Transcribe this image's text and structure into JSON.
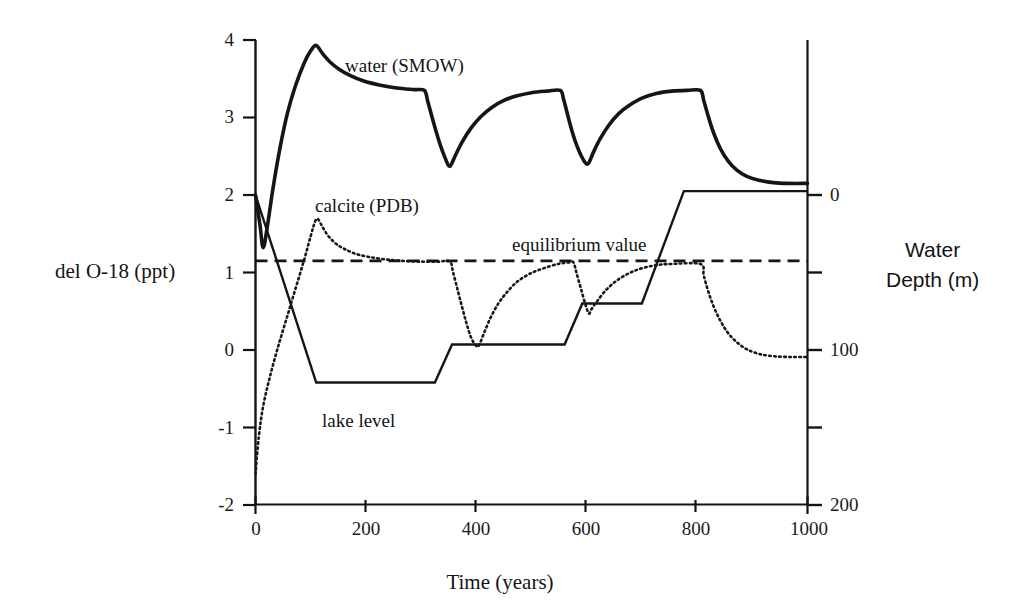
{
  "chart_data": {
    "type": "line",
    "title": "",
    "xlabel": "Time (years)",
    "ylabel": "del O-18 (ppt)",
    "y2label": "Water\nDepth  (m)",
    "y2label_line1": "Water",
    "y2label_line2": "Depth  (m)",
    "xlim": [
      0,
      1000
    ],
    "ylim": [
      -2,
      4
    ],
    "y2lim": [
      0,
      200
    ],
    "grid": false,
    "legend_position": "inline-annotations",
    "xticks": [
      0,
      200,
      400,
      600,
      800,
      1000
    ],
    "xtick_labels": [
      "0",
      "200",
      "400",
      "600",
      "800",
      "1000"
    ],
    "xminorticks": [
      100,
      300,
      500,
      700,
      900
    ],
    "yticks": [
      -2,
      -1,
      0,
      1,
      2,
      3,
      4
    ],
    "ytick_labels": [
      "-2",
      "-1",
      "0",
      "1",
      "2",
      "3",
      "4"
    ],
    "y2ticks": [
      0,
      50,
      100,
      150,
      200
    ],
    "y2tick_labels": [
      "0",
      "",
      "100",
      "",
      "200"
    ],
    "annotations": [
      {
        "name": "water-smow-label",
        "text": "water (SMOW)",
        "x": 370,
        "y": 3.73
      },
      {
        "name": "calcite-pdb-label",
        "text": "calcite (PDB)",
        "x": 185,
        "y": 1.93
      },
      {
        "name": "equilibrium-value-label",
        "text": "equilibrium value",
        "x": 600,
        "y": 1.52
      },
      {
        "name": "lake-level-label",
        "text": "lake level",
        "x": 215,
        "y": -0.93
      }
    ],
    "series": [
      {
        "name": "water (SMOW)",
        "style": "solid-thick",
        "axis": "left",
        "color": "#151515",
        "points": [
          [
            0,
            2.0
          ],
          [
            8,
            1.62
          ],
          [
            14,
            1.32
          ],
          [
            22,
            1.62
          ],
          [
            32,
            2.1
          ],
          [
            45,
            2.63
          ],
          [
            58,
            3.06
          ],
          [
            72,
            3.4
          ],
          [
            88,
            3.7
          ],
          [
            100,
            3.86
          ],
          [
            110,
            3.93
          ],
          [
            122,
            3.82
          ],
          [
            136,
            3.71
          ],
          [
            152,
            3.62
          ],
          [
            172,
            3.54
          ],
          [
            196,
            3.47
          ],
          [
            224,
            3.42
          ],
          [
            256,
            3.38
          ],
          [
            288,
            3.36
          ],
          [
            306,
            3.35
          ],
          [
            312,
            3.21
          ],
          [
            320,
            3.0
          ],
          [
            328,
            2.8
          ],
          [
            336,
            2.62
          ],
          [
            344,
            2.47
          ],
          [
            352,
            2.37
          ],
          [
            362,
            2.51
          ],
          [
            374,
            2.68
          ],
          [
            390,
            2.86
          ],
          [
            408,
            3.01
          ],
          [
            428,
            3.13
          ],
          [
            450,
            3.22
          ],
          [
            474,
            3.28
          ],
          [
            500,
            3.32
          ],
          [
            528,
            3.34
          ],
          [
            552,
            3.35
          ],
          [
            558,
            3.24
          ],
          [
            566,
            3.02
          ],
          [
            574,
            2.81
          ],
          [
            582,
            2.64
          ],
          [
            592,
            2.48
          ],
          [
            602,
            2.4
          ],
          [
            612,
            2.55
          ],
          [
            624,
            2.72
          ],
          [
            640,
            2.9
          ],
          [
            658,
            3.05
          ],
          [
            678,
            3.16
          ],
          [
            700,
            3.25
          ],
          [
            726,
            3.31
          ],
          [
            754,
            3.34
          ],
          [
            782,
            3.35
          ],
          [
            806,
            3.35
          ],
          [
            812,
            3.22
          ],
          [
            820,
            3.02
          ],
          [
            830,
            2.8
          ],
          [
            842,
            2.6
          ],
          [
            856,
            2.44
          ],
          [
            872,
            2.32
          ],
          [
            890,
            2.24
          ],
          [
            912,
            2.19
          ],
          [
            938,
            2.16
          ],
          [
            965,
            2.15
          ],
          [
            1000,
            2.15
          ]
        ]
      },
      {
        "name": "calcite (PDB)",
        "style": "dotted",
        "axis": "left",
        "color": "#181818",
        "points": [
          [
            0,
            -1.6
          ],
          [
            6,
            -1.12
          ],
          [
            14,
            -0.72
          ],
          [
            26,
            -0.35
          ],
          [
            40,
            0.02
          ],
          [
            56,
            0.4
          ],
          [
            72,
            0.78
          ],
          [
            88,
            1.16
          ],
          [
            100,
            1.47
          ],
          [
            108,
            1.66
          ],
          [
            113,
            1.69
          ],
          [
            122,
            1.58
          ],
          [
            132,
            1.47
          ],
          [
            146,
            1.37
          ],
          [
            162,
            1.3
          ],
          [
            182,
            1.24
          ],
          [
            206,
            1.2
          ],
          [
            234,
            1.17
          ],
          [
            266,
            1.15
          ],
          [
            300,
            1.14
          ],
          [
            330,
            1.14
          ],
          [
            352,
            1.14
          ],
          [
            358,
            1.0
          ],
          [
            366,
            0.78
          ],
          [
            374,
            0.56
          ],
          [
            382,
            0.35
          ],
          [
            390,
            0.17
          ],
          [
            398,
            0.07
          ],
          [
            404,
            0.05
          ],
          [
            414,
            0.22
          ],
          [
            426,
            0.42
          ],
          [
            440,
            0.6
          ],
          [
            456,
            0.75
          ],
          [
            474,
            0.88
          ],
          [
            496,
            0.98
          ],
          [
            520,
            1.05
          ],
          [
            548,
            1.11
          ],
          [
            568,
            1.13
          ],
          [
            576,
            1.13
          ],
          [
            582,
            0.98
          ],
          [
            590,
            0.78
          ],
          [
            598,
            0.58
          ],
          [
            604,
            0.47
          ],
          [
            608,
            0.52
          ],
          [
            618,
            0.62
          ],
          [
            632,
            0.75
          ],
          [
            648,
            0.86
          ],
          [
            666,
            0.95
          ],
          [
            686,
            1.02
          ],
          [
            708,
            1.07
          ],
          [
            732,
            1.1
          ],
          [
            752,
            1.11
          ],
          [
            806,
            1.11
          ],
          [
            812,
            0.96
          ],
          [
            820,
            0.76
          ],
          [
            830,
            0.56
          ],
          [
            842,
            0.38
          ],
          [
            856,
            0.22
          ],
          [
            872,
            0.1
          ],
          [
            890,
            0.01
          ],
          [
            912,
            -0.05
          ],
          [
            938,
            -0.08
          ],
          [
            968,
            -0.09
          ],
          [
            1000,
            -0.09
          ]
        ]
      },
      {
        "name": "lake level",
        "style": "solid",
        "axis": "right",
        "color": "#151515",
        "points_left_units": [
          [
            0,
            2.0
          ],
          [
            110,
            -0.42
          ],
          [
            325,
            -0.42
          ],
          [
            356,
            0.07
          ],
          [
            560,
            0.07
          ],
          [
            592,
            0.6
          ],
          [
            700,
            0.6
          ],
          [
            776,
            2.05
          ],
          [
            1000,
            2.05
          ]
        ],
        "depth_points": [
          [
            0,
            0
          ],
          [
            110,
            80
          ],
          [
            325,
            80
          ],
          [
            356,
            64
          ],
          [
            560,
            64
          ],
          [
            592,
            46
          ],
          [
            700,
            46
          ],
          [
            776,
            0
          ],
          [
            1000,
            0
          ]
        ]
      },
      {
        "name": "equilibrium value",
        "style": "dashed",
        "axis": "left",
        "color": "#151515",
        "constant": 1.15,
        "points": [
          [
            0,
            1.15
          ],
          [
            1000,
            1.15
          ]
        ]
      }
    ]
  }
}
